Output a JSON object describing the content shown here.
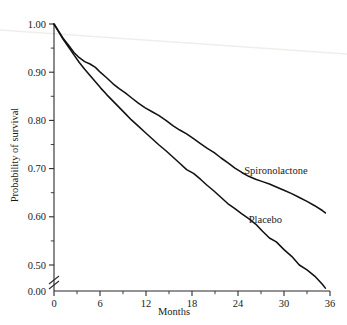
{
  "chart_data": {
    "type": "line",
    "title": "",
    "subtitle": "",
    "xlabel": "Months",
    "ylabel": "Probability of survival",
    "xlim": [
      0,
      36
    ],
    "ylim": [
      0.44,
      1.0
    ],
    "y_axis_broken": true,
    "y_break_below": 0.46,
    "grid": false,
    "legend_position": "inline-annotation",
    "x_ticks": [
      0,
      6,
      12,
      18,
      24,
      30,
      36
    ],
    "x_tick_labels": [
      "0",
      "6",
      "12",
      "18",
      "24",
      "30",
      "36"
    ],
    "x_minor_ticks": [
      3,
      9,
      15,
      21,
      27,
      33
    ],
    "y_ticks": [
      1.0,
      0.9,
      0.8,
      0.7,
      0.6,
      0.5,
      0.0
    ],
    "y_tick_labels": [
      "1.00",
      "0.90",
      "0.80",
      "0.70",
      "0.60",
      "0.50",
      "0.00"
    ],
    "y_minor_ticks": [
      0.95,
      0.85,
      0.75,
      0.65,
      0.55
    ],
    "series": [
      {
        "name": "Spironolactone",
        "label": "Spironolactone",
        "color": "#111111",
        "annotation_x": 24.8,
        "annotation_y": 0.688,
        "x": [
          0,
          0.6,
          1.2,
          1.9,
          2.6,
          3.3,
          4.0,
          4.7,
          5.4,
          6.1,
          6.9,
          7.7,
          8.5,
          9.3,
          10.1,
          11.0,
          11.9,
          12.8,
          13.7,
          14.6,
          15.5,
          16.4,
          17.3,
          18.2,
          19.1,
          20.0,
          20.9,
          21.8,
          22.7,
          23.6,
          24.5,
          25.4,
          26.3,
          27.2,
          28.1,
          29.0,
          30.0,
          31.0,
          32.0,
          33.0,
          34.0,
          35.0,
          35.4
        ],
        "y": [
          1.0,
          0.985,
          0.97,
          0.956,
          0.941,
          0.93,
          0.922,
          0.917,
          0.91,
          0.899,
          0.888,
          0.876,
          0.866,
          0.857,
          0.847,
          0.836,
          0.826,
          0.818,
          0.81,
          0.8,
          0.789,
          0.78,
          0.772,
          0.762,
          0.752,
          0.742,
          0.733,
          0.722,
          0.712,
          0.701,
          0.692,
          0.684,
          0.678,
          0.673,
          0.668,
          0.662,
          0.655,
          0.648,
          0.64,
          0.632,
          0.623,
          0.613,
          0.608
        ]
      },
      {
        "name": "Placebo",
        "label": "Placebo",
        "color": "#111111",
        "annotation_x": 25.4,
        "annotation_y": 0.588,
        "x": [
          0,
          0.6,
          1.2,
          1.9,
          2.6,
          3.3,
          4.0,
          4.7,
          5.4,
          6.1,
          6.9,
          7.7,
          8.5,
          9.3,
          10.1,
          11.0,
          11.9,
          12.8,
          13.7,
          14.6,
          15.5,
          16.4,
          17.3,
          18.2,
          19.1,
          20.0,
          20.9,
          21.8,
          22.7,
          23.6,
          24.5,
          25.4,
          26.3,
          27.2,
          28.1,
          29.0,
          30.0,
          31.0,
          32.0,
          33.0,
          34.0,
          35.0,
          35.4
        ],
        "y": [
          1.0,
          0.984,
          0.968,
          0.952,
          0.936,
          0.92,
          0.906,
          0.893,
          0.88,
          0.867,
          0.853,
          0.84,
          0.827,
          0.814,
          0.801,
          0.788,
          0.775,
          0.762,
          0.749,
          0.737,
          0.724,
          0.711,
          0.698,
          0.69,
          0.678,
          0.665,
          0.653,
          0.64,
          0.627,
          0.617,
          0.606,
          0.596,
          0.585,
          0.57,
          0.556,
          0.548,
          0.532,
          0.518,
          0.5,
          0.49,
          0.477,
          0.46,
          0.452
        ]
      }
    ]
  }
}
